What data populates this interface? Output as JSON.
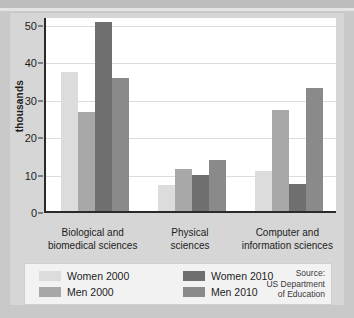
{
  "chart_data": {
    "type": "bar",
    "title": "",
    "xlabel": "",
    "ylabel": "thousands",
    "ylim": [
      0,
      52
    ],
    "yticks": [
      0,
      10,
      20,
      30,
      40,
      50
    ],
    "grid": true,
    "legend_position": "bottom",
    "categories": [
      "Biological and biomedical sciences",
      "Physical sciences",
      "Computer and information sciences"
    ],
    "category_lines": [
      [
        "Biological and",
        "biomedical sciences"
      ],
      [
        "Physical",
        "sciences"
      ],
      [
        "Computer and",
        "information sciences"
      ]
    ],
    "series": [
      {
        "name": "Women 2000",
        "color": "#dcdcdc",
        "values": [
          37.0,
          7.0,
          10.8
        ]
      },
      {
        "name": "Men 2000",
        "color": "#a8a8a8",
        "values": [
          26.5,
          11.2,
          27.0
        ]
      },
      {
        "name": "Women 2010",
        "color": "#6f6f6f",
        "values": [
          50.5,
          9.5,
          7.3
        ]
      },
      {
        "name": "Men 2010",
        "color": "#8a8a8a",
        "values": [
          35.5,
          13.6,
          32.8
        ]
      }
    ],
    "source_lines": [
      "Source:",
      "US Department",
      "of Education"
    ]
  },
  "legend": {
    "items": [
      {
        "label": "Women 2000"
      },
      {
        "label": "Men 2000"
      },
      {
        "label": "Women 2010"
      },
      {
        "label": "Men 2010"
      }
    ]
  },
  "colors": {
    "page_background": "#c9c9c9",
    "panel_background": "#d6d6d6",
    "plot_background": "#ffffff",
    "axis": "#2a2a2a",
    "gridline": "#dcdcdc",
    "legend_background": "#f2f2f2"
  }
}
